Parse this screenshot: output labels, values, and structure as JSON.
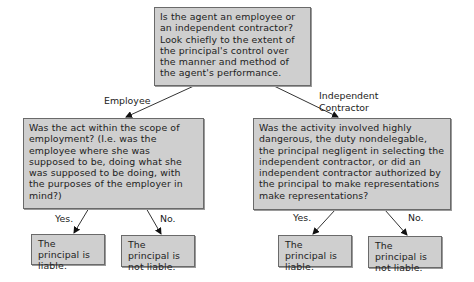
{
  "diagram": {
    "root": {
      "text": "Is the agent an employee or an independent contractor? Look chiefly to the extent of the principal's control over the manner and method of the agent's performance."
    },
    "branches": [
      {
        "edge_label": "Employee",
        "question": "Was the act within the scope of employment?  (I.e. was the employee where she was supposed to be, doing what she was supposed to be doing, with the purposes of the employer in mind?)",
        "outcomes": [
          {
            "edge_label": "Yes.",
            "text": "The principal is liable."
          },
          {
            "edge_label": "No.",
            "text": "The principal is not liable."
          }
        ]
      },
      {
        "edge_label_line1": "Independent",
        "edge_label_line2": "Contractor",
        "question": "Was the activity involved highly dangerous, the duty nondelegable, the principal negligent in selecting the independent contractor, or did an independent contractor authorized by the principal to make representations make representations?",
        "outcomes": [
          {
            "edge_label": "Yes.",
            "text": "The principal is liable."
          },
          {
            "edge_label": "No.",
            "text": "The principal is not liable."
          }
        ]
      }
    ]
  }
}
